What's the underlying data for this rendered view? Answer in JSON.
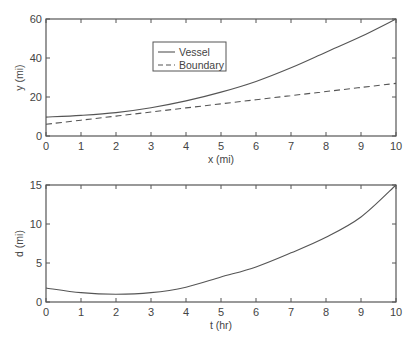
{
  "chart_data": [
    {
      "type": "line",
      "title": "",
      "xlabel": "x (mi)",
      "ylabel": "y (mi)",
      "xlim": [
        0,
        10
      ],
      "ylim": [
        0,
        60
      ],
      "xticks": [
        "0",
        "1",
        "2",
        "3",
        "4",
        "5",
        "6",
        "7",
        "8",
        "9",
        "10"
      ],
      "yticks": [
        "0",
        "20",
        "40",
        "60"
      ],
      "grid": false,
      "legend_position": "upper-left-center",
      "x": [
        0,
        1,
        2,
        3,
        4,
        5,
        6,
        7,
        8,
        9,
        10
      ],
      "series": [
        {
          "name": "Vessel",
          "style": "solid",
          "values": [
            9.7,
            10.6,
            12.0,
            14.5,
            18.0,
            22.5,
            28.0,
            35.0,
            43.0,
            51.0,
            60.0
          ]
        },
        {
          "name": "Boundary",
          "style": "dashed",
          "values": [
            6.0,
            8.1,
            10.2,
            12.3,
            14.4,
            16.5,
            18.6,
            20.7,
            22.8,
            24.9,
            27.0
          ]
        }
      ]
    },
    {
      "type": "line",
      "title": "",
      "xlabel": "t (hr)",
      "ylabel": "d (mi)",
      "xlim": [
        0,
        10
      ],
      "ylim": [
        0,
        15
      ],
      "xticks": [
        "0",
        "1",
        "2",
        "3",
        "4",
        "5",
        "6",
        "7",
        "8",
        "9",
        "10"
      ],
      "yticks": [
        "0",
        "5",
        "10",
        "15"
      ],
      "grid": false,
      "x": [
        0,
        1,
        2,
        3,
        4,
        5,
        6,
        7,
        8,
        9,
        10
      ],
      "series": [
        {
          "name": "d",
          "style": "solid",
          "values": [
            1.8,
            1.2,
            1.0,
            1.2,
            1.9,
            3.2,
            4.5,
            6.3,
            8.3,
            10.9,
            15.0
          ]
        }
      ]
    }
  ],
  "plots": {
    "top": {
      "xlabel": "x (mi)",
      "ylabel": "y (mi)",
      "legend": {
        "vessel": "Vessel",
        "boundary": "Boundary"
      }
    },
    "bottom": {
      "xlabel": "t (hr)",
      "ylabel": "d (mi)"
    }
  },
  "colors": {
    "line": "#555555",
    "axis": "#555555",
    "text": "#444444"
  }
}
